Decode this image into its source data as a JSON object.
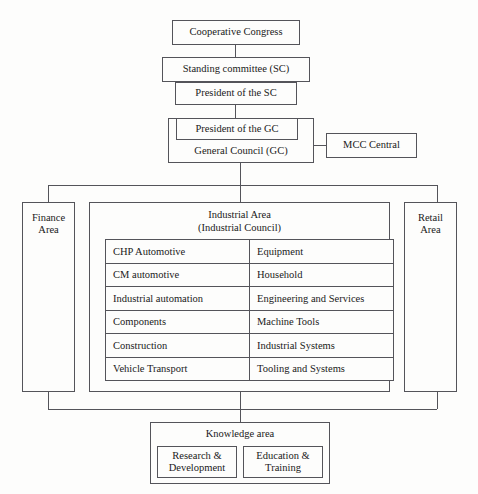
{
  "diagram": {
    "line_color": "#54545a",
    "background": "#fdfdfc"
  },
  "governance": {
    "congress": "Cooperative Congress",
    "standing_committee": "Standing committee (SC)",
    "president_sc": "President of the SC",
    "president_gc": "President of the GC",
    "general_council": "General Council (GC)",
    "mcc_central": "MCC Central"
  },
  "areas": {
    "finance": "Finance\nArea",
    "retail": "Retail\nArea",
    "industrial_title": "Industrial Area\n(Industrial Council)"
  },
  "industrial_divisions": [
    {
      "left": "CHP Automotive",
      "right": "Equipment"
    },
    {
      "left": "CM automotive",
      "right": "Household"
    },
    {
      "left": "Industrial automation",
      "right": "Engineering and Services"
    },
    {
      "left": "Components",
      "right": "Machine Tools"
    },
    {
      "left": "Construction",
      "right": "Industrial Systems"
    },
    {
      "left": "Vehicle Transport",
      "right": "Tooling and Systems"
    }
  ],
  "knowledge": {
    "title": "Knowledge area",
    "units": [
      "Research &\nDevelopment",
      "Education &\nTraining"
    ]
  }
}
